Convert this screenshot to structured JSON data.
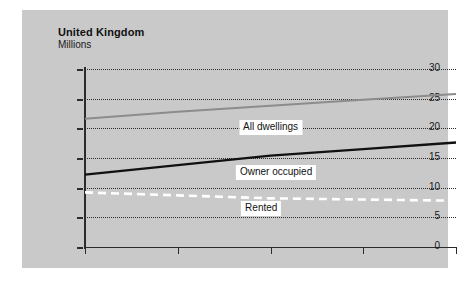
{
  "header": {
    "title": "United Kingdom",
    "subtitle": "Millions"
  },
  "chart_data": {
    "type": "line",
    "title": "United Kingdom",
    "subtitle": "Millions",
    "xlabel": "",
    "ylabel": "Millions",
    "xlim": [
      1981,
      2001
    ],
    "ylim": [
      0,
      30
    ],
    "grid": true,
    "legend_position": "inline-labels",
    "x_ticks": [
      "1981",
      "1986",
      "1991",
      "1996",
      "2001"
    ],
    "x_tick_values": [
      1981,
      1986,
      1991,
      1996,
      2001
    ],
    "y_ticks": [
      "0",
      "5",
      "10",
      "15",
      "20",
      "25",
      "30"
    ],
    "y_tick_values": [
      0,
      5,
      10,
      15,
      20,
      25,
      30
    ],
    "x": [
      1981,
      1986,
      1991,
      1996,
      2001
    ],
    "series": [
      {
        "name": "All dwellings",
        "values": [
          21.6,
          22.8,
          23.8,
          24.8,
          25.8
        ],
        "color": "#8c8c8c",
        "style": "solid",
        "label": "All dwellings"
      },
      {
        "name": "Owner occupied",
        "values": [
          12.2,
          13.8,
          15.4,
          16.5,
          17.6
        ],
        "color": "#111111",
        "style": "solid",
        "label": "Owner occupied"
      },
      {
        "name": "Rented",
        "values": [
          9.2,
          8.7,
          8.2,
          8.0,
          7.8
        ],
        "color": "#ffffff",
        "style": "dashed",
        "label": "Rented"
      }
    ],
    "annotations": [
      {
        "text": "All dwellings",
        "x": 1991.0,
        "y": 20.2
      },
      {
        "text": "Owner occupied",
        "x": 1991.3,
        "y": 12.6
      },
      {
        "text": "Rented",
        "x": 1990.5,
        "y": 6.6
      }
    ]
  }
}
